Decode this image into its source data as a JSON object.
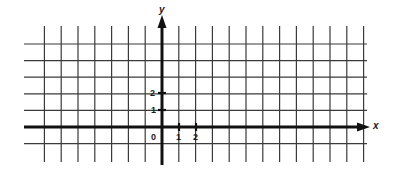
{
  "diagram": {
    "type": "coordinate-grid",
    "colors": {
      "grid": "#3a3a3a",
      "axis": "#111111",
      "background": "#ffffff"
    },
    "axes": {
      "x_label": "x",
      "y_label": "y",
      "origin_label": "0",
      "x_tick_labels": [
        "1",
        "2"
      ],
      "y_tick_labels": [
        "1",
        "2"
      ]
    },
    "grid": {
      "columns_left_of_y_axis": 7,
      "columns_right_of_y_axis": 12,
      "rows_above_x_axis": 5,
      "rows_below_x_axis": 1
    }
  }
}
